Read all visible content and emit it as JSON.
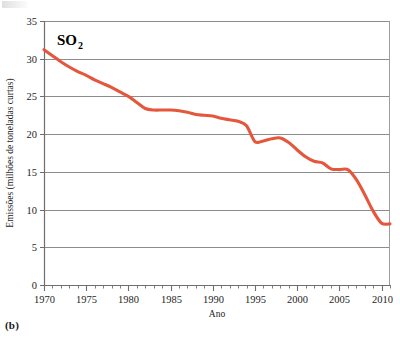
{
  "figure": {
    "panel_label": "(b)",
    "series_title_main": "SO",
    "series_title_subscript": "2",
    "line_color": "#E4573C",
    "grid_color": "#8c8c8c",
    "axis_color": "#6e6e6e",
    "background": "#ffffff"
  },
  "chart_data": {
    "type": "line",
    "xlabel": "Ano",
    "ylabel": "Emissões (milhões de toneladas curtas)",
    "xlim": [
      1970,
      2011
    ],
    "ylim": [
      0,
      35
    ],
    "xticks": [
      1970,
      1975,
      1980,
      1985,
      1990,
      1995,
      2000,
      2005,
      2010
    ],
    "xtick_labels": [
      "1970",
      "1975",
      "1980",
      "1985",
      "1990",
      "1995",
      "2000",
      "2005",
      "2010"
    ],
    "yticks": [
      0,
      5,
      10,
      15,
      20,
      25,
      30,
      35
    ],
    "ytick_labels": [
      "0",
      "5",
      "10",
      "15",
      "20",
      "25",
      "30",
      "35"
    ],
    "minor_xtick_interval": 1,
    "grid": "horizontal",
    "legend": "none",
    "series": [
      {
        "name": "SO2",
        "color": "#E4573C",
        "x": [
          1970,
          1971,
          1972,
          1973,
          1974,
          1975,
          1976,
          1977,
          1978,
          1979,
          1980,
          1981,
          1982,
          1983,
          1984,
          1985,
          1986,
          1987,
          1988,
          1989,
          1990,
          1991,
          1992,
          1993,
          1994,
          1995,
          1996,
          1997,
          1998,
          1999,
          2000,
          2001,
          2002,
          2003,
          2004,
          2005,
          2006,
          2007,
          2008,
          2009,
          2010,
          2011
        ],
        "values": [
          31.2,
          30.4,
          29.6,
          28.9,
          28.3,
          27.8,
          27.2,
          26.7,
          26.2,
          25.6,
          25.0,
          24.2,
          23.4,
          23.2,
          23.2,
          23.2,
          23.1,
          22.9,
          22.6,
          22.5,
          22.4,
          22.1,
          21.9,
          21.7,
          21.1,
          19.0,
          19.1,
          19.4,
          19.5,
          18.9,
          17.9,
          17.0,
          16.4,
          16.2,
          15.4,
          15.3,
          15.3,
          14.0,
          12.0,
          9.8,
          8.2,
          8.1
        ]
      }
    ]
  }
}
